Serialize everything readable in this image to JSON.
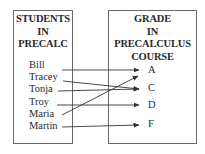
{
  "diagram": {
    "type": "mapping",
    "domain_box": {
      "title_lines": [
        "STUDENTS",
        "IN",
        "PRECALC"
      ],
      "items": [
        "Bill",
        "Tracey",
        "Tonja",
        "Troy",
        "Maria",
        "Martin"
      ]
    },
    "range_box": {
      "title_lines": [
        "GRADE",
        "IN",
        "PRECALCULUS",
        "COURSE"
      ],
      "items": [
        "A",
        "C",
        "D",
        "F"
      ]
    },
    "mappings": [
      {
        "from": "Bill",
        "to": "A"
      },
      {
        "from": "Tracey",
        "to": "C"
      },
      {
        "from": "Tonja",
        "to": "C"
      },
      {
        "from": "Troy",
        "to": "D"
      },
      {
        "from": "Maria",
        "to": "A"
      },
      {
        "from": "Martin",
        "to": "F"
      }
    ],
    "colors": {
      "line": "#333333",
      "border": "#6a6a6a",
      "text": "#2a2a2a"
    }
  }
}
